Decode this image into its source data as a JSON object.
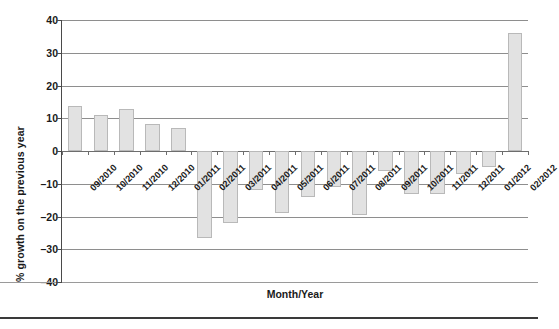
{
  "chart_data": {
    "type": "bar",
    "title": "",
    "xlabel": "Month/Year",
    "ylabel": "% growth on the previous year",
    "ylim": [
      -40,
      40
    ],
    "ytick_step": 10,
    "yticks": [
      40,
      30,
      20,
      10,
      0,
      -10,
      -20,
      -30,
      -40
    ],
    "ytick_labels": [
      "40",
      "30",
      "20",
      "10",
      "0",
      "–10",
      "–20",
      "–30",
      "–40"
    ],
    "grid": true,
    "legend": false,
    "bar_color": "#e2e2e2",
    "bar_border_color": "#b9b9b9",
    "categories": [
      "09/2010",
      "10/2010",
      "11/2010",
      "12/2010",
      "01/2011",
      "02/2011",
      "03/2011",
      "04/2011",
      "05/2011",
      "06/2011",
      "07/2011",
      "08/2011",
      "09/2011",
      "10/2011",
      "11/2011",
      "12/2011",
      "01/2012",
      "02/2012"
    ],
    "values": [
      13.8,
      11.0,
      12.8,
      8.3,
      7.0,
      -26.5,
      -22.0,
      -12.0,
      -19.0,
      -14.0,
      -11.0,
      -19.5,
      -6.0,
      -13.0,
      -13.0,
      -7.0,
      -5.0,
      36.0
    ]
  },
  "axes": {
    "y_title": "% growth on the previous year",
    "x_title": "Month/Year"
  }
}
